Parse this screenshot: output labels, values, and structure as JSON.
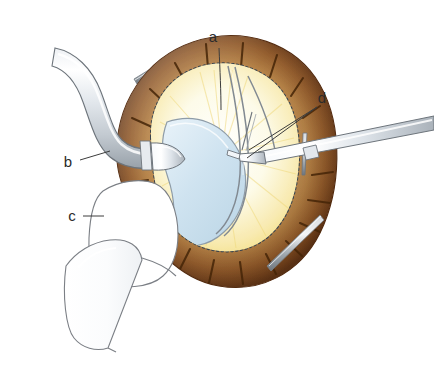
{
  "figure": {
    "background_color": "#ffffff",
    "width": 434,
    "height": 374
  },
  "labels": [
    {
      "id": "a",
      "text": "a",
      "x": 213,
      "y": 42,
      "leader_from": [
        219,
        48
      ],
      "leader_to": [
        221,
        110
      ],
      "target": "wound-edge-upper"
    },
    {
      "id": "b",
      "text": "b",
      "x": 68,
      "y": 167,
      "leader_from": [
        80,
        160
      ],
      "leader_to": [
        108,
        152
      ],
      "target": "curved-cannula"
    },
    {
      "id": "c",
      "text": "c",
      "x": 72,
      "y": 221,
      "leader_from": [
        83,
        216
      ],
      "leader_to": [
        103,
        216
      ],
      "target": "outline-instrument"
    },
    {
      "id": "d",
      "text": "d",
      "x": 322,
      "y": 103,
      "leader_from": [
        318,
        107
      ],
      "leader_to": [
        248,
        152
      ],
      "target": "forceps-tip"
    }
  ],
  "anatomy": {
    "ring": {
      "name": "sclera-ring",
      "color_outer_dark": "#6b3a16",
      "color_mid": "#a9642c",
      "color_highlight": "#d9a86a",
      "color_inner_light": "#c89a63",
      "hash_mark_color": "#4a2a10",
      "hash_mark_count": 22,
      "dotted_border_color": "#3e4a55"
    },
    "fundus": {
      "name": "fundus-glow",
      "color_center": "#ffffff",
      "color_edge": "#f2de76",
      "description": "radial yellow glow inside opening"
    },
    "lens_flap": {
      "name": "lens-flap",
      "fill": "#cfe2ef",
      "stroke": "#8a9aa6",
      "description": "pale blue crescent lens flap"
    },
    "sutures": {
      "name": "suture-loop",
      "stroke": "#7c848c",
      "count": 3
    }
  },
  "instruments": [
    {
      "id": "curved-cannula",
      "name": "curved-cannula",
      "label_ref": "b",
      "fill": "#f4f6f8",
      "stroke": "#6e757c",
      "description": "curved tubular cannula entering from upper left"
    },
    {
      "id": "outline-instrument",
      "name": "outline-instrument",
      "label_ref": "c",
      "fill": "#ffffff",
      "stroke": "#7b7f85",
      "description": "line-drawn handpiece below left"
    },
    {
      "id": "forceps",
      "name": "forceps",
      "label_ref": "d",
      "fill": "#f0f3f6",
      "stroke": "#6e757c",
      "description": "straight forceps entering from right grasping suture"
    }
  ],
  "pins": [
    {
      "name": "pin-upper-left",
      "x1": 133,
      "y1": 78,
      "x2": 179,
      "y2": 53,
      "color": "#9aa1a8"
    },
    {
      "name": "pin-lower-right",
      "x1": 268,
      "y1": 264,
      "x2": 323,
      "y2": 218,
      "color": "#9aa1a8"
    },
    {
      "name": "pin-ring-right",
      "x1": 305,
      "y1": 135,
      "x2": 303,
      "y2": 172,
      "color": "#7d848b"
    }
  ]
}
